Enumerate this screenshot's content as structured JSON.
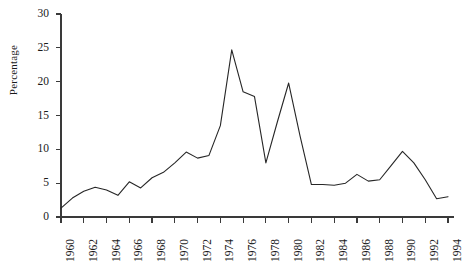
{
  "chart_data": {
    "type": "line",
    "title": "",
    "subtitle": "",
    "xlabel": "",
    "ylabel": "Percentage",
    "xlim": [
      1960,
      1994
    ],
    "ylim": [
      0,
      30
    ],
    "grid": false,
    "legend": false,
    "legend_position": "none",
    "line_color": "#262626",
    "background_color": "#ffffff",
    "x_tick_labels": [
      "1960",
      "1962",
      "1964",
      "1966",
      "1968",
      "1970",
      "1972",
      "1974",
      "1976",
      "1978",
      "1980",
      "1982",
      "1984",
      "1986",
      "1988",
      "1990",
      "1992",
      "1994"
    ],
    "x_tick_values": [
      1960,
      1962,
      1964,
      1966,
      1968,
      1970,
      1972,
      1974,
      1976,
      1978,
      1980,
      1982,
      1984,
      1986,
      1988,
      1990,
      1992,
      1994
    ],
    "y_tick_labels": [
      "0",
      "5",
      "10",
      "15",
      "20",
      "25",
      "30"
    ],
    "y_tick_values": [
      0,
      5,
      10,
      15,
      20,
      25,
      30
    ],
    "series": [
      {
        "name": "Percentage",
        "x": [
          1960,
          1961,
          1962,
          1963,
          1964,
          1965,
          1966,
          1967,
          1968,
          1969,
          1970,
          1971,
          1972,
          1973,
          1974,
          1975,
          1976,
          1977,
          1978,
          1979,
          1980,
          1981,
          1982,
          1983,
          1984,
          1985,
          1986,
          1987,
          1988,
          1989,
          1990,
          1991,
          1992,
          1993,
          1994
        ],
        "values": [
          1.3,
          2.8,
          3.8,
          4.4,
          4.0,
          3.2,
          5.2,
          4.3,
          5.8,
          6.6,
          8.0,
          9.6,
          8.7,
          9.1,
          13.5,
          24.7,
          18.5,
          17.8,
          8.0,
          14.0,
          19.8,
          12.0,
          4.8,
          4.8,
          4.7,
          5.0,
          6.3,
          5.3,
          5.5,
          7.6,
          9.7,
          8.0,
          5.5,
          2.7,
          3.0
        ]
      }
    ]
  }
}
